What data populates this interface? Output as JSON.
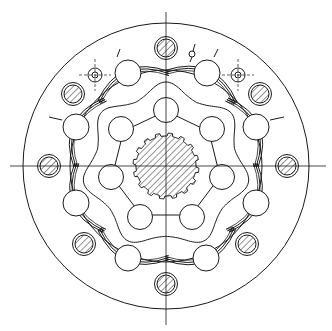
{
  "diagram": {
    "title": "",
    "type": "technical-drawing",
    "canvas": {
      "width": 332,
      "height": 331
    },
    "colors": {
      "line": "#1a1a1a",
      "background": "#ffffff"
    },
    "center": {
      "x": 166,
      "y": 166
    },
    "centerlines": {
      "horizontal": {
        "x1": 10,
        "x2": 326,
        "y": 166
      },
      "vertical": {
        "x": 166,
        "y1": 12,
        "y2": 325
      }
    },
    "outer_housing": {
      "r": 143
    },
    "splined_shaft": {
      "r_outer": 33,
      "r_root": 30,
      "teeth": 16,
      "hatched": true
    },
    "inner_rotor": {
      "roller_radius": 12.5,
      "rollers": [
        {
          "x": 166,
          "y": 110
        },
        {
          "x": 212,
          "y": 129
        },
        {
          "x": 222,
          "y": 177
        },
        {
          "x": 192,
          "y": 217
        },
        {
          "x": 140,
          "y": 217
        },
        {
          "x": 111,
          "y": 177
        },
        {
          "x": 121,
          "y": 129
        }
      ]
    },
    "outer_rollers": {
      "roller_radius": 13,
      "rollers": [
        {
          "x": 128,
          "y": 73
        },
        {
          "x": 207,
          "y": 73
        },
        {
          "x": 256,
          "y": 127
        },
        {
          "x": 256,
          "y": 203
        },
        {
          "x": 206,
          "y": 258
        },
        {
          "x": 128,
          "y": 258
        },
        {
          "x": 76,
          "y": 203
        },
        {
          "x": 76,
          "y": 127
        }
      ]
    },
    "bolt_pins": {
      "radius": 9,
      "ring_radius": 11.5,
      "hatched": true,
      "pins": [
        {
          "x": 166,
          "y": 48
        },
        {
          "x": 260,
          "y": 94
        },
        {
          "x": 287,
          "y": 166
        },
        {
          "x": 247,
          "y": 244
        },
        {
          "x": 166,
          "y": 284
        },
        {
          "x": 84,
          "y": 244
        },
        {
          "x": 49,
          "y": 166
        },
        {
          "x": 73,
          "y": 94
        }
      ]
    },
    "small_holes": [
      {
        "x": 95,
        "y": 75,
        "r_outer": 7,
        "r_inner": 3
      },
      {
        "x": 238,
        "y": 75,
        "r_outer": 7,
        "r_inner": 3
      }
    ],
    "top_valve": {
      "x": 193,
      "y": 52
    },
    "ribs": [
      {
        "x1": 117,
        "y1": 57,
        "x2": 120,
        "y2": 49
      },
      {
        "x1": 214,
        "y1": 57,
        "x2": 218,
        "y2": 49
      },
      {
        "x1": 62,
        "y1": 120,
        "x2": 49,
        "y2": 117
      },
      {
        "x1": 270,
        "y1": 120,
        "x2": 284,
        "y2": 117
      }
    ]
  }
}
